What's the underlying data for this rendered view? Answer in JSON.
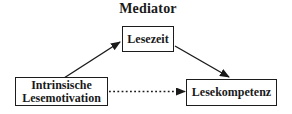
{
  "diagram": {
    "title": "Mediator",
    "nodes": {
      "predictor": {
        "line1": "Intrinsische",
        "line2": "Lesemotivation"
      },
      "mediator": {
        "label": "Lesezeit"
      },
      "outcome": {
        "label": "Lesekompetenz"
      }
    },
    "edges": [
      {
        "from": "Intrinsische Lesemotivation",
        "to": "Lesezeit",
        "style": "solid-arrow"
      },
      {
        "from": "Lesezeit",
        "to": "Lesekompetenz",
        "style": "solid-arrow"
      },
      {
        "from": "Intrinsische Lesemotivation",
        "to": "Lesekompetenz",
        "style": "dotted-arrow"
      }
    ],
    "colors": {
      "background": "#ffffff",
      "stroke": "#1a1a1a",
      "text": "#1a1a1a"
    }
  }
}
